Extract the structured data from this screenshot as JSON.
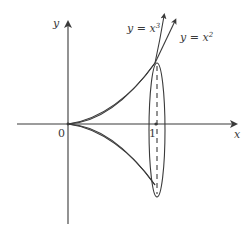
{
  "diagram": {
    "type": "solid-of-revolution",
    "colors": {
      "stroke": "#3a3a3a",
      "fill": "#c8c8c8",
      "background": "#ffffff"
    },
    "axes": {
      "x_label": "x",
      "y_label": "y",
      "origin_label": "0",
      "tick_label_x1": "1"
    },
    "curves": [
      {
        "name": "cubic",
        "label_prefix": "y = x",
        "exponent": "3"
      },
      {
        "name": "square",
        "label_prefix": "y = x",
        "exponent": "2"
      }
    ],
    "region": {
      "x_range": [
        0,
        1
      ],
      "upper_curve": "y = x^2",
      "lower_curve": "y = x^3",
      "mirrored_below_axis": true
    },
    "disk": {
      "at_x": 1,
      "shape": "ellipse",
      "center_line": "dashed"
    }
  }
}
